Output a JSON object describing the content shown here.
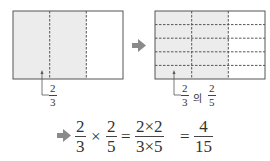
{
  "colors": {
    "shade": "#ececec",
    "stroke": "#555555",
    "dash": "#555555",
    "arrow": "#8a8a8a",
    "text": "#333333"
  },
  "left_diagram": {
    "columns": 3,
    "rows": 1,
    "shaded_columns": 2,
    "label": {
      "numerator": "2",
      "denominator": "3"
    }
  },
  "right_diagram": {
    "columns": 3,
    "rows": 5,
    "shaded_columns": 2,
    "label": {
      "first": {
        "numerator": "2",
        "denominator": "3"
      },
      "connector": "의",
      "second": {
        "numerator": "2",
        "denominator": "5"
      }
    }
  },
  "equation": {
    "term1": {
      "numerator": "2",
      "denominator": "3"
    },
    "times": "×",
    "term2": {
      "numerator": "2",
      "denominator": "5"
    },
    "equals1": "=",
    "term3": {
      "numerator": "2×2",
      "denominator": "3×5"
    },
    "equals2": "=",
    "result": {
      "numerator": "4",
      "denominator": "15"
    }
  }
}
